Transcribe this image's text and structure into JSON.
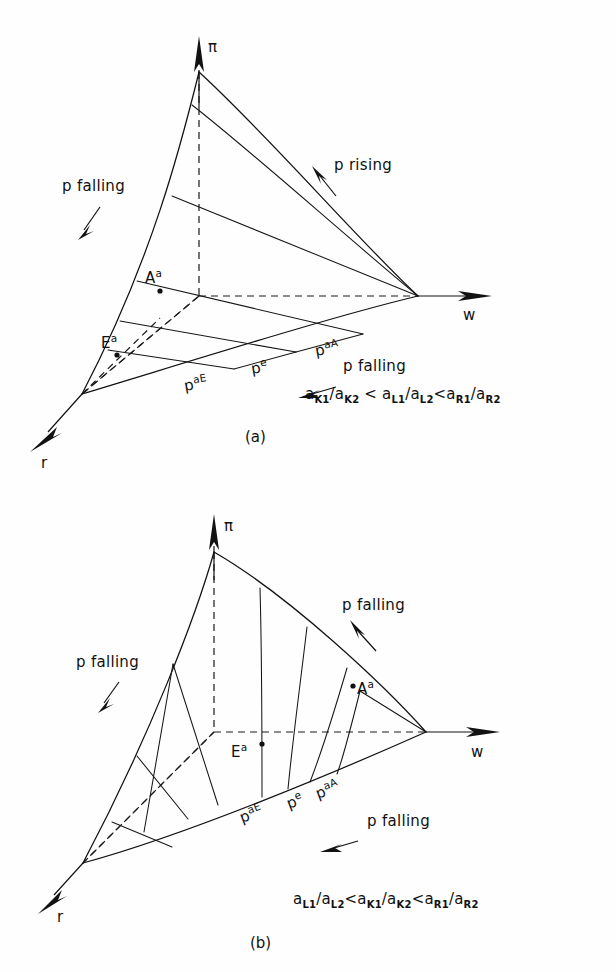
{
  "figure": {
    "type": "technical-diagram",
    "background_color": "#ffffff",
    "line_color": "#121212"
  },
  "panels": [
    {
      "id": "a",
      "caption": "(a)",
      "axes": {
        "vertical": "π",
        "right": "w",
        "left": "r"
      },
      "point_labels": [
        {
          "base": "A",
          "sup": "a"
        },
        {
          "base": "E",
          "sup": "a"
        }
      ],
      "edge_labels": [
        {
          "base": "p",
          "sup": "aE"
        },
        {
          "base": "p",
          "sup": "e"
        },
        {
          "base": "p",
          "sup": "aA"
        }
      ],
      "annotations": [
        {
          "text": "p falling",
          "arrow": "down-right"
        },
        {
          "text": "p rising",
          "arrow": "up-left"
        },
        {
          "text": "p falling",
          "arrow": "left"
        }
      ],
      "inequality": {
        "terms": [
          {
            "base": "a",
            "sub": "K1"
          },
          {
            "base": "a",
            "sub": "K2"
          },
          {
            "base": "a",
            "sub": "L1"
          },
          {
            "base": "a",
            "sub": "L2"
          },
          {
            "base": "a",
            "sub": "R1"
          },
          {
            "base": "a",
            "sub": "R2"
          }
        ],
        "plain": "a_K1/a_K2 < a_L1/a_L2 < a_R1/a_R2",
        "operators": [
          "/",
          "<",
          "/",
          "<",
          "/"
        ]
      }
    },
    {
      "id": "b",
      "caption": "(b)",
      "axes": {
        "vertical": "π",
        "right": "w",
        "left": "r"
      },
      "point_labels": [
        {
          "base": "A",
          "sup": "a"
        },
        {
          "base": "E",
          "sup": "a"
        }
      ],
      "edge_labels": [
        {
          "base": "p",
          "sup": "aE"
        },
        {
          "base": "p",
          "sup": "e"
        },
        {
          "base": "p",
          "sup": "aA"
        }
      ],
      "annotations": [
        {
          "text": "p falling",
          "arrow": "down-right"
        },
        {
          "text": "p falling",
          "arrow": "up-left"
        },
        {
          "text": "p falling",
          "arrow": "left"
        }
      ],
      "inequality": {
        "terms": [
          {
            "base": "a",
            "sub": "L1"
          },
          {
            "base": "a",
            "sub": "L2"
          },
          {
            "base": "a",
            "sub": "K1"
          },
          {
            "base": "a",
            "sub": "K2"
          },
          {
            "base": "a",
            "sub": "R1"
          },
          {
            "base": "a",
            "sub": "R2"
          }
        ],
        "plain": "a_L1/a_L2 < a_K1/a_K2 < a_R1/a_R2",
        "operators": [
          "/",
          "<",
          "/",
          "<",
          "/"
        ]
      }
    }
  ],
  "glyphs": {
    "slash": "/",
    "less_than": "<",
    "p": "p",
    "a": "a",
    "A": "A",
    "E": "E",
    "pi": "π",
    "w": "w",
    "r": "r"
  },
  "text": {
    "p_falling": "p falling",
    "p_rising": "p rising",
    "caption_a": "(a)",
    "caption_b": "(b)"
  }
}
